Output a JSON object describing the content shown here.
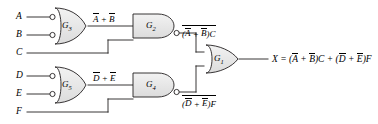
{
  "diagram": {
    "background_color": "#ffffff",
    "line_color": "#231f20",
    "gate_fill_color": "#e8e8e8",
    "inputs": [
      {
        "name": "A",
        "label": "A"
      },
      {
        "name": "B",
        "label": "B"
      },
      {
        "name": "C",
        "label": "C"
      },
      {
        "name": "D",
        "label": "D"
      },
      {
        "name": "E",
        "label": "E"
      },
      {
        "name": "F",
        "label": "F"
      }
    ],
    "gates": [
      {
        "id": "G3",
        "label": "G",
        "subscript": "3",
        "type": "or-with-inverted-inputs"
      },
      {
        "id": "G2",
        "label": "G",
        "subscript": "2",
        "type": "nand"
      },
      {
        "id": "G5",
        "label": "G",
        "subscript": "5",
        "type": "or-with-inverted-inputs"
      },
      {
        "id": "G4",
        "label": "G",
        "subscript": "4",
        "type": "nand"
      },
      {
        "id": "G1",
        "label": "G",
        "subscript": "1",
        "type": "or"
      }
    ],
    "wire_labels": {
      "g3_out": {
        "a": "A",
        "plus": " + ",
        "b": "B"
      },
      "g5_out": {
        "d": "D",
        "plus": " + ",
        "e": "E"
      },
      "g2_out": {
        "open": "(",
        "a": "A",
        "plus": " + ",
        "b": "B",
        "close": ")",
        "c": "C"
      },
      "g4_out": {
        "open": "(",
        "d": "D",
        "plus": " + ",
        "e": "E",
        "close": ")",
        "f": "F"
      }
    },
    "output_equation": {
      "x": "X",
      "eq": " = (",
      "a": "A",
      "plus1": " + ",
      "b": "B",
      "close1": ")",
      "c": "C",
      "plus2": " + (",
      "d": "D",
      "plus3": " + ",
      "e": "E",
      "close2": ")",
      "f": "F"
    }
  }
}
